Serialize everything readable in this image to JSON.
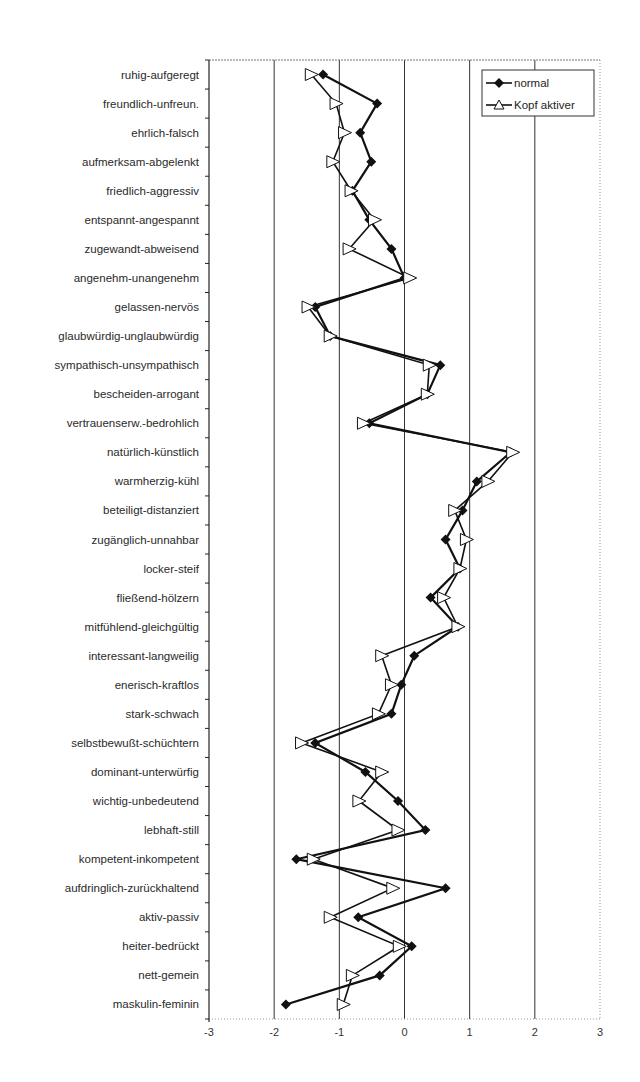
{
  "chart_data": {
    "type": "line",
    "orientation": "horizontal-profile",
    "title": "",
    "xlabel": "",
    "ylabel": "",
    "xlim": [
      -3,
      3
    ],
    "xticks": [
      -3,
      -2,
      -1,
      0,
      1,
      2,
      3
    ],
    "xtick_labels": [
      "-3",
      "-2",
      "-1",
      "0",
      "1",
      "2",
      "3"
    ],
    "grid": "vertical gridlines at integer x values",
    "legend_position": "top-right inside plot",
    "categories": [
      "ruhig-aufgeregt",
      "freundlich-unfreun.",
      "ehrlich-falsch",
      "aufmerksam-abgelenkt",
      "friedlich-aggressiv",
      "entspannt-angespannt",
      "zugewandt-abweisend",
      "angenehm-unangenehm",
      "gelassen-nervös",
      "glaubwürdig-unglaubwürdig",
      "sympathisch-unsympathisch",
      "bescheiden-arrogant",
      "vertrauenserw.-bedrohlich",
      "natürlich-künstlich",
      "warmherzig-kühl",
      "beteiligt-distanziert",
      "zugänglich-unnahbar",
      "locker-steif",
      "fließend-hölzern",
      "mitfühlend-gleichgültig",
      "interessant-langweilig",
      "enerisch-kraftlos",
      "stark-schwach",
      "selbstbewußt-schüchtern",
      "dominant-unterwürfig",
      "wichtig-unbedeutend",
      "lebhaft-still",
      "kompetent-inkompetent",
      "aufdringlich-zurückhaltend",
      "aktiv-passiv",
      "heiter-bedrückt",
      "nett-gemein",
      "maskulin-feminin"
    ],
    "series": [
      {
        "name": "normal",
        "marker": "filled-diamond",
        "color": "#111111",
        "values": [
          -1.25,
          -0.42,
          -0.68,
          -0.51,
          -0.8,
          -0.54,
          -0.2,
          0.0,
          -1.37,
          -1.14,
          0.55,
          0.35,
          -0.54,
          1.63,
          1.11,
          0.89,
          0.63,
          0.85,
          0.4,
          0.82,
          0.15,
          -0.05,
          -0.2,
          -1.37,
          -0.6,
          -0.1,
          0.32,
          -1.66,
          0.63,
          -0.71,
          0.11,
          -0.38,
          -1.82
        ]
      },
      {
        "name": "Kopf aktiver",
        "marker": "open-triangle",
        "color": "#111111",
        "values": [
          -1.43,
          -1.05,
          -0.92,
          -1.1,
          -0.82,
          -0.46,
          -0.85,
          0.08,
          -1.48,
          -1.14,
          0.38,
          0.35,
          -0.63,
          1.66,
          1.28,
          0.77,
          0.95,
          0.85,
          0.6,
          0.82,
          -0.35,
          -0.2,
          -0.4,
          -1.58,
          -0.35,
          -0.7,
          -0.1,
          -1.4,
          -0.18,
          -1.14,
          -0.08,
          -0.8,
          -0.94
        ]
      }
    ]
  },
  "legend": {
    "items": [
      {
        "label": "normal"
      },
      {
        "label": "Kopf aktiver"
      }
    ]
  },
  "colors": {
    "line": "#111111",
    "grid": "#333333",
    "frame_dotted": "#999999",
    "background": "#ffffff"
  }
}
